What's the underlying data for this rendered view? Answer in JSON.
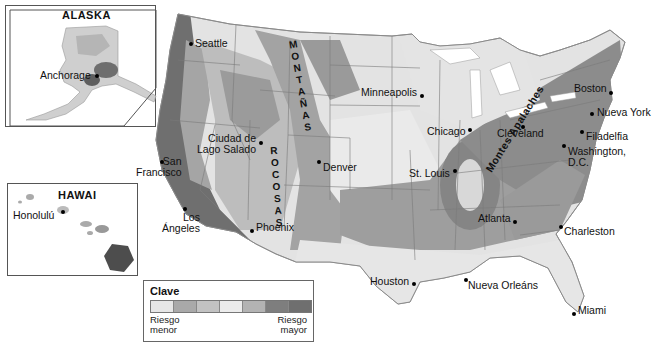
{
  "map": {
    "title": "Riesgo sísmico en Estados Unidos",
    "insets": {
      "alaska": {
        "title": "ALASKA",
        "cities": [
          {
            "name": "Anchorage"
          }
        ]
      },
      "hawaii": {
        "title": "HAWAI",
        "cities": [
          {
            "name": "Honolulú"
          }
        ]
      }
    },
    "cities": [
      {
        "id": "seattle",
        "name": "Seattle"
      },
      {
        "id": "san-francisco",
        "name": "San Francisco",
        "line1": "San",
        "line2": "Francisco"
      },
      {
        "id": "los-angeles",
        "name": "Los Ángeles",
        "line1": "Los",
        "line2": "Ángeles"
      },
      {
        "id": "salt-lake",
        "name": "Ciudad de Lago Salado",
        "line1": "Ciudad de",
        "line2": "Lago Salado"
      },
      {
        "id": "phoenix",
        "name": "Phoenix"
      },
      {
        "id": "denver",
        "name": "Denver"
      },
      {
        "id": "minneapolis",
        "name": "Minneapolis"
      },
      {
        "id": "chicago",
        "name": "Chicago"
      },
      {
        "id": "st-louis",
        "name": "St. Louis"
      },
      {
        "id": "houston",
        "name": "Houston"
      },
      {
        "id": "new-orleans",
        "name": "Nueva Orleáns"
      },
      {
        "id": "atlanta",
        "name": "Atlanta"
      },
      {
        "id": "charleston",
        "name": "Charleston"
      },
      {
        "id": "miami",
        "name": "Miami"
      },
      {
        "id": "cleveland",
        "name": "Cleveland"
      },
      {
        "id": "washington",
        "name": "Washington, D.C.",
        "line1": "Washington,",
        "line2": "D.C."
      },
      {
        "id": "philadelphia",
        "name": "Filadelfia"
      },
      {
        "id": "new-york",
        "name": "Nueva York"
      },
      {
        "id": "boston",
        "name": "Boston"
      }
    ],
    "features": [
      {
        "id": "rockies",
        "name": "MONTAÑAS ROCOSAS",
        "part1": "MONTAÑAS",
        "part2": "ROCOSAS"
      },
      {
        "id": "appalachians",
        "name": "Montes Apalaches"
      }
    ]
  },
  "legend": {
    "title": "Clave",
    "low_label_1": "Riesgo",
    "low_label_2": "menor",
    "high_label_1": "Riesgo",
    "high_label_2": "mayor",
    "swatches": [
      "#e6e6e6",
      "#a9a9a9",
      "#c2c2c2",
      "#ececec",
      "#b3b3b3",
      "#7e7e7e",
      "#6f6f6f"
    ]
  }
}
